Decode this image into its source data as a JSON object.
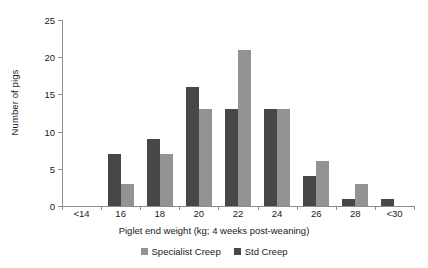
{
  "chart_data": {
    "type": "bar",
    "title": "",
    "xlabel": "Piglet end weight (kg; 4 weeks post-weaning)",
    "ylabel": "Number of pigs",
    "categories": [
      "<14",
      "16",
      "18",
      "20",
      "22",
      "24",
      "26",
      "28",
      "<30"
    ],
    "series": [
      {
        "name": "Std Creep",
        "color": "#474747",
        "values": [
          0,
          7,
          9,
          16,
          13,
          13,
          4,
          1,
          1
        ]
      },
      {
        "name": "Specialist Creep",
        "color": "#939393",
        "values": [
          0,
          3,
          7,
          13,
          21,
          13,
          6,
          3,
          0
        ]
      }
    ],
    "ylim": [
      0,
      25
    ],
    "yticks": [
      0,
      5,
      10,
      15,
      20,
      25
    ],
    "ytick_labels": [
      "0",
      "5",
      "10",
      "15",
      "20",
      "25"
    ],
    "grid": false,
    "legend_position": "bottom-center",
    "legend_order": [
      "Specialist Creep",
      "Std Creep"
    ],
    "bar_draw_order_left_to_right": [
      "Std Creep",
      "Specialist Creep"
    ]
  },
  "legend": {
    "entries": [
      {
        "label": "Specialist Creep",
        "color": "#939393"
      },
      {
        "label": "Std Creep",
        "color": "#474747"
      }
    ]
  },
  "axes": {
    "y_title": "Number of pigs",
    "x_title": "Piglet end weight (kg; 4 weeks post-weaning)"
  }
}
